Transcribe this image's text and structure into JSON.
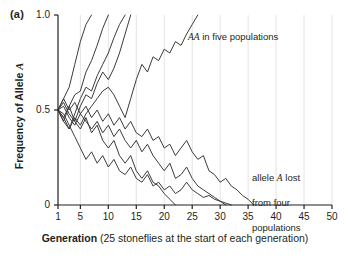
{
  "panel": {
    "label": "(a)"
  },
  "axes": {
    "ylabel_prefix": "Frequency of Allele ",
    "ylabel_italic": "A",
    "xlabel_bold": "Generation",
    "xlabel_rest": " (25 stoneflies at the start of each generation)",
    "yticks": [
      "1.0",
      "0.5",
      "0"
    ],
    "xticks": [
      "1",
      "5",
      "10",
      "15",
      "20",
      "25",
      "30",
      "35",
      "40",
      "45",
      "50"
    ]
  },
  "annotations": {
    "fixed": {
      "pre": "",
      "italic": "AA",
      "post": " in five populations"
    },
    "lost": {
      "line1_pre": "allele ",
      "line1_italic": "A",
      "line1_post": " lost",
      "line2": "from four",
      "line3": "populations"
    }
  },
  "colors": {
    "line": "#3b3b3b",
    "axis": "#231f20",
    "grid": "#e3e3e3",
    "background": "#ffffff",
    "text": "#231f20"
  },
  "chart_data": {
    "type": "line",
    "title": "",
    "subtitle": "",
    "xlabel": "Generation (25 stoneflies at the start of each generation)",
    "ylabel": "Frequency of Allele A",
    "xlim": [
      1,
      50
    ],
    "ylim": [
      0,
      1.0
    ],
    "grid": "vertical-only",
    "legend": "none",
    "annotations": [
      "AA in five populations",
      "allele A lost from four populations"
    ],
    "series": [
      {
        "name": "population-1-fixed",
        "outcome": "fixation",
        "x": [
          1,
          2,
          3,
          4,
          5,
          6,
          7
        ],
        "values": [
          0.5,
          0.56,
          0.62,
          0.74,
          0.86,
          0.95,
          1.0
        ]
      },
      {
        "name": "population-2-fixed",
        "outcome": "fixation",
        "x": [
          1,
          2,
          3,
          4,
          5,
          6,
          7,
          8,
          9,
          10
        ],
        "values": [
          0.5,
          0.44,
          0.52,
          0.58,
          0.6,
          0.7,
          0.76,
          0.84,
          0.93,
          1.0
        ]
      },
      {
        "name": "population-3-fixed",
        "outcome": "fixation",
        "x": [
          1,
          2,
          3,
          4,
          5,
          6,
          7,
          8,
          9,
          10,
          11,
          12,
          13
        ],
        "values": [
          0.5,
          0.46,
          0.4,
          0.48,
          0.56,
          0.62,
          0.6,
          0.68,
          0.74,
          0.8,
          0.88,
          0.95,
          1.0
        ]
      },
      {
        "name": "population-4-fixed",
        "outcome": "fixation",
        "x": [
          1,
          2,
          3,
          4,
          5,
          6,
          7,
          8,
          9,
          10,
          11,
          12,
          13,
          14
        ],
        "values": [
          0.5,
          0.54,
          0.48,
          0.44,
          0.52,
          0.58,
          0.56,
          0.64,
          0.7,
          0.66,
          0.72,
          0.8,
          0.9,
          1.0
        ]
      },
      {
        "name": "population-5-fixed",
        "outcome": "fixation",
        "x": [
          1,
          2,
          3,
          4,
          5,
          6,
          7,
          8,
          9,
          10,
          11,
          12,
          13,
          14,
          15,
          16,
          17,
          18,
          19,
          20,
          21,
          22,
          23,
          24,
          25,
          26
        ],
        "values": [
          0.5,
          0.44,
          0.4,
          0.46,
          0.42,
          0.48,
          0.52,
          0.56,
          0.6,
          0.62,
          0.58,
          0.52,
          0.46,
          0.56,
          0.66,
          0.74,
          0.7,
          0.78,
          0.76,
          0.82,
          0.8,
          0.86,
          0.84,
          0.9,
          0.95,
          1.0
        ]
      },
      {
        "name": "population-6-lost",
        "outcome": "loss",
        "x": [
          1,
          2,
          3,
          4,
          5,
          6,
          7,
          8,
          9,
          10,
          11,
          12,
          13,
          14,
          15,
          16,
          17,
          18,
          19,
          20,
          21,
          22
        ],
        "values": [
          0.5,
          0.46,
          0.52,
          0.44,
          0.4,
          0.46,
          0.38,
          0.42,
          0.34,
          0.3,
          0.34,
          0.26,
          0.22,
          0.26,
          0.18,
          0.14,
          0.18,
          0.12,
          0.1,
          0.06,
          0.03,
          0.0
        ]
      },
      {
        "name": "population-7-lost",
        "outcome": "loss",
        "x": [
          1,
          2,
          3,
          4,
          5,
          6,
          7,
          8,
          9,
          10,
          11,
          12,
          13,
          14,
          15,
          16,
          17,
          18,
          19,
          20,
          21,
          22,
          23,
          24,
          25,
          26,
          27,
          28,
          29,
          30,
          31
        ],
        "values": [
          0.5,
          0.52,
          0.46,
          0.42,
          0.48,
          0.44,
          0.4,
          0.44,
          0.38,
          0.42,
          0.36,
          0.4,
          0.34,
          0.3,
          0.34,
          0.28,
          0.32,
          0.26,
          0.22,
          0.18,
          0.22,
          0.14,
          0.16,
          0.2,
          0.14,
          0.1,
          0.08,
          0.06,
          0.04,
          0.02,
          0.0
        ]
      },
      {
        "name": "population-8-lost",
        "outcome": "loss",
        "x": [
          1,
          2,
          3,
          4,
          5,
          6,
          7,
          8,
          9,
          10,
          11,
          12,
          13,
          14,
          15,
          16,
          17,
          18,
          19,
          20,
          21,
          22,
          23,
          24,
          25,
          26,
          27,
          28,
          29,
          30,
          31,
          32
        ],
        "values": [
          0.5,
          0.48,
          0.42,
          0.36,
          0.3,
          0.24,
          0.28,
          0.22,
          0.26,
          0.2,
          0.24,
          0.18,
          0.16,
          0.2,
          0.14,
          0.12,
          0.16,
          0.1,
          0.12,
          0.08,
          0.1,
          0.06,
          0.08,
          0.12,
          0.08,
          0.06,
          0.04,
          0.05,
          0.03,
          0.02,
          0.01,
          0.0
        ]
      },
      {
        "name": "population-9-lost",
        "outcome": "loss",
        "x": [
          1,
          2,
          3,
          4,
          5,
          6,
          7,
          8,
          9,
          10,
          11,
          12,
          13,
          14,
          15,
          16,
          17,
          18,
          19,
          20,
          21,
          22,
          23,
          24,
          25,
          26,
          27,
          28,
          29,
          30,
          31,
          32,
          33,
          34,
          35,
          36
        ],
        "values": [
          0.5,
          0.56,
          0.5,
          0.54,
          0.48,
          0.52,
          0.46,
          0.5,
          0.44,
          0.48,
          0.42,
          0.46,
          0.4,
          0.44,
          0.38,
          0.36,
          0.4,
          0.34,
          0.36,
          0.3,
          0.32,
          0.26,
          0.3,
          0.34,
          0.28,
          0.24,
          0.26,
          0.18,
          0.16,
          0.12,
          0.14,
          0.1,
          0.08,
          0.05,
          0.03,
          0.0
        ]
      }
    ]
  }
}
